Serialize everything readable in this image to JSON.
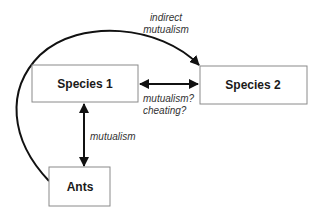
{
  "diagram": {
    "nodes": [
      {
        "id": "species1",
        "label": "Species 1"
      },
      {
        "id": "species2",
        "label": "Species 2"
      },
      {
        "id": "ants",
        "label": "Ants"
      }
    ],
    "edges": [
      {
        "id": "ants-to-species2",
        "from": "ants",
        "to": "species2",
        "direction": "forward",
        "label_lines": [
          "indirect",
          "mutualism"
        ]
      },
      {
        "id": "species1-species2",
        "from": "species1",
        "to": "species2",
        "direction": "both",
        "label_lines": [
          "mutualism?",
          "cheating?"
        ]
      },
      {
        "id": "species1-ants",
        "from": "species1",
        "to": "ants",
        "direction": "both",
        "label_lines": [
          "mutualism"
        ]
      }
    ]
  }
}
